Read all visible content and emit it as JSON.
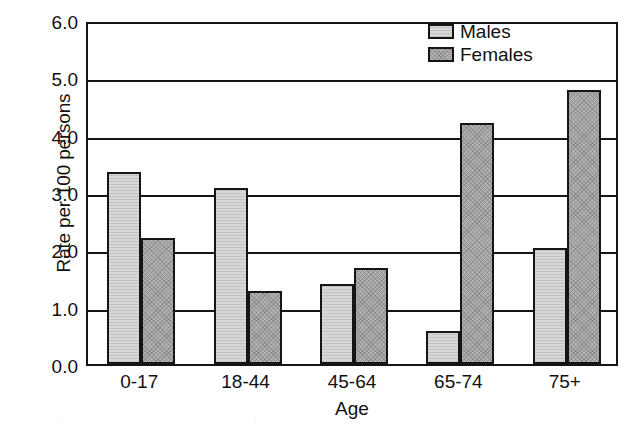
{
  "chart_data": {
    "type": "bar",
    "title": "",
    "xlabel": "Age",
    "ylabel": "Rate per 100 persons",
    "categories": [
      "0-17",
      "18-44",
      "45-64",
      "65-74",
      "75+"
    ],
    "series": [
      {
        "name": "Males",
        "color": "#d7d7d7",
        "values": [
          3.35,
          3.07,
          1.39,
          0.57,
          2.03
        ]
      },
      {
        "name": "Females",
        "color": "#b2b2b2",
        "values": [
          2.2,
          1.28,
          1.68,
          4.2,
          4.78
        ]
      }
    ],
    "ylim": [
      0.0,
      6.0
    ],
    "yticks": [
      "0.0",
      "1.0",
      "2.0",
      "3.0",
      "4.0",
      "5.0",
      "6.0"
    ],
    "ytick_values": [
      0.0,
      1.0,
      2.0,
      3.0,
      4.0,
      5.0,
      6.0
    ],
    "grid": true,
    "grid_axis": "y",
    "legend_position": "top-right"
  },
  "legend": {
    "entries": [
      {
        "label": "Males"
      },
      {
        "label": "Females"
      }
    ]
  },
  "axes": {
    "y_title": "Rate per 100 persons",
    "x_title": "Age"
  }
}
